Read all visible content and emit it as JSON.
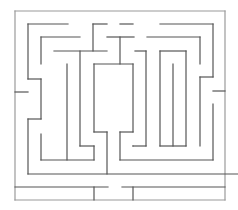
{
  "maze": {
    "width": 238,
    "height": 210,
    "wall_color": "#555555",
    "border_color": "#9a9a9a",
    "wall_width": 1.2,
    "border": [
      [
        15,
        11,
        225,
        11
      ],
      [
        225,
        11,
        225,
        200
      ],
      [
        15,
        200,
        225,
        200
      ],
      [
        15,
        11,
        15,
        200
      ]
    ],
    "walls": [
      [
        28,
        24,
        68,
        24
      ],
      [
        28,
        24,
        28,
        79
      ],
      [
        28,
        79,
        41,
        79
      ],
      [
        41,
        79,
        41,
        119
      ],
      [
        41,
        119,
        28,
        119
      ],
      [
        28,
        119,
        28,
        174
      ],
      [
        28,
        174,
        238,
        174
      ],
      [
        15,
        92,
        28,
        92
      ],
      [
        41,
        37,
        80,
        37
      ],
      [
        41,
        37,
        41,
        64
      ],
      [
        54,
        51,
        107,
        51
      ],
      [
        67,
        64,
        67,
        160
      ],
      [
        80,
        51,
        80,
        146
      ],
      [
        80,
        146,
        94,
        146
      ],
      [
        94,
        146,
        94,
        160
      ],
      [
        41,
        134,
        41,
        160
      ],
      [
        41,
        160,
        94,
        160
      ],
      [
        93,
        24,
        107,
        24
      ],
      [
        93,
        24,
        93,
        51
      ],
      [
        120,
        24,
        133,
        24
      ],
      [
        107,
        37,
        134,
        37
      ],
      [
        120,
        37,
        120,
        64
      ],
      [
        94,
        64,
        133,
        64
      ],
      [
        94,
        64,
        94,
        132
      ],
      [
        94,
        132,
        107,
        132
      ],
      [
        107,
        132,
        107,
        174
      ],
      [
        133,
        64,
        133,
        132
      ],
      [
        133,
        132,
        120,
        132
      ],
      [
        120,
        132,
        120,
        160
      ],
      [
        120,
        160,
        213,
        160
      ],
      [
        135,
        51,
        146,
        51
      ],
      [
        146,
        51,
        146,
        146
      ],
      [
        146,
        146,
        133,
        146
      ],
      [
        133,
        146,
        133,
        146
      ],
      [
        160,
        24,
        213,
        24
      ],
      [
        213,
        24,
        213,
        77
      ],
      [
        213,
        77,
        200,
        77
      ],
      [
        200,
        77,
        200,
        146
      ],
      [
        147,
        37,
        200,
        37
      ],
      [
        200,
        37,
        200,
        64
      ],
      [
        160,
        51,
        186,
        51
      ],
      [
        160,
        51,
        160,
        146
      ],
      [
        160,
        146,
        186,
        146
      ],
      [
        186,
        51,
        186,
        146
      ],
      [
        173,
        64,
        173,
        146
      ],
      [
        213,
        91,
        225,
        91
      ],
      [
        213,
        104,
        213,
        160
      ],
      [
        15,
        187,
        108,
        187
      ],
      [
        122,
        187,
        225,
        187
      ],
      [
        94,
        187,
        94,
        200
      ],
      [
        133,
        187,
        133,
        200
      ]
    ]
  }
}
